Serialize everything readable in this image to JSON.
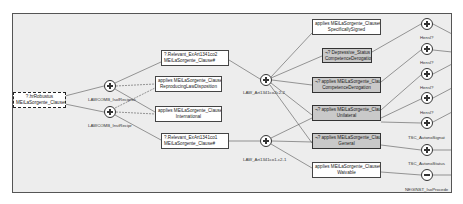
{
  "diagram": {
    "root": {
      "line1": "?.hrRobustus",
      "line2": "MEiLaSorgente_Clause#"
    },
    "combiners_left": [
      {
        "label": "LAWCOMB_IsolReciproc",
        "type": "plus"
      },
      {
        "label": "LAWCOMB_InstRecipr",
        "type": "plus"
      }
    ],
    "middle_nodes": [
      {
        "line1": "?.Relevant_ExArt1341co2",
        "line2": "MEiLaSorgente_Clause#"
      },
      {
        "line1": "applies MEiLaSorgente_Clause#",
        "line2": "ReproducingLawDisposition"
      },
      {
        "line1": "applies MEiLaSorgente_Clause#",
        "line2": "International"
      },
      {
        "line1": "?.Relevant_ExArt1341co1",
        "line2": "MEiLaSorgente_Clause#"
      }
    ],
    "combiners_mid": [
      {
        "label": "LAW_Art1341co2c2-2",
        "type": "plus"
      },
      {
        "label": "LAW_Art1341co1-c2-1",
        "type": "plus"
      }
    ],
    "right_nodes": [
      {
        "line1": "applies MEiLaSorgente_Clause#",
        "line2": "SpecificallySigned",
        "style": "white"
      },
      {
        "line1": "¬? Depressive_Status",
        "line2": "CompetenceDerogation",
        "style": "gray"
      },
      {
        "line1": "¬? applies MEiLaSorgente_Clause#",
        "line2": "CompetenceDerogation",
        "style": "gray"
      },
      {
        "line1": "¬? applies MEiLaSorgente_Clause#",
        "line2": "Unilateral",
        "style": "gray"
      },
      {
        "line1": "¬? applies MEiLaSorgente_Clause#",
        "line2": "General",
        "style": "gray"
      },
      {
        "line1": "applies MEiLaSorgente_Clause#",
        "line2": "Waivable",
        "style": "white"
      }
    ],
    "combiners_right": [
      {
        "label": "",
        "type": "plus"
      },
      {
        "label": "Hensl?",
        "type": "plus"
      },
      {
        "label": "Hensl?",
        "type": "plus"
      },
      {
        "label": "Hensl?",
        "type": "plus"
      },
      {
        "label": "Hensl?",
        "type": "plus"
      },
      {
        "label": "TSC_AutonoSignat",
        "type": "plus"
      },
      {
        "label": "TSC_AutonoStatus",
        "type": "minus"
      }
    ],
    "footer_label": "NEGINST_IsoProcede"
  }
}
